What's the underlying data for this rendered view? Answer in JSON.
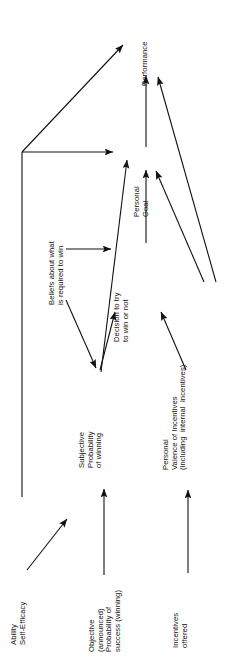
{
  "diagram": {
    "orientation": "rotated-90-ccw",
    "stroke_color": "#111111",
    "background_color": "#ffffff",
    "nodes": [
      {
        "id": "ability",
        "label": "Ability\nSelf-Efficacy"
      },
      {
        "id": "objective",
        "label": "Objective\n(announced)\nProbability of\nsuccess (winning)"
      },
      {
        "id": "incentives",
        "label": "Incentives\noffered"
      },
      {
        "id": "subjective",
        "label": "Subjective\nProbability\nof winning"
      },
      {
        "id": "beliefs",
        "label": "Beliefs about what\nis required to win"
      },
      {
        "id": "valence",
        "label": "Personal\nValence of Incentives\n(including  internal  incentives)"
      },
      {
        "id": "decision",
        "label": "Decision to try\nto win or not"
      },
      {
        "id": "goal",
        "label": "Personal\nGoal"
      },
      {
        "id": "performance",
        "label": "Performance"
      }
    ],
    "edges": [
      {
        "from": "ability",
        "to": "beliefs"
      },
      {
        "from": "ability",
        "to": "goal"
      },
      {
        "from": "ability",
        "to": "performance"
      },
      {
        "from": "objective",
        "to": "subjective"
      },
      {
        "from": "incentives",
        "to": "valence"
      },
      {
        "from": "beliefs",
        "to": "subjective"
      },
      {
        "from": "beliefs",
        "to": "decision"
      },
      {
        "from": "subjective",
        "to": "decision"
      },
      {
        "from": "valence",
        "to": "decision"
      },
      {
        "from": "valence",
        "to": "goal"
      },
      {
        "from": "valence",
        "to": "performance"
      },
      {
        "from": "decision",
        "to": "goal"
      },
      {
        "from": "goal",
        "to": "performance"
      }
    ]
  }
}
